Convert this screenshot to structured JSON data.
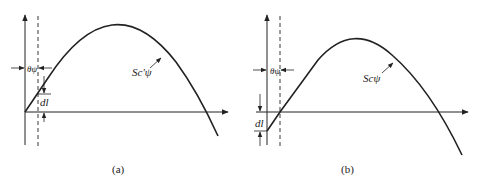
{
  "figure": {
    "panels": [
      {
        "id": "a",
        "caption": "(a)",
        "curve_label": "Sc'ψ",
        "angle_label": "θψ",
        "offset_label": "dl"
      },
      {
        "id": "b",
        "caption": "(b)",
        "curve_label": "Scψ",
        "angle_label": "θψ",
        "offset_label": "dl"
      }
    ],
    "colors": {
      "line": "#222222",
      "background": "#ffffff"
    }
  }
}
